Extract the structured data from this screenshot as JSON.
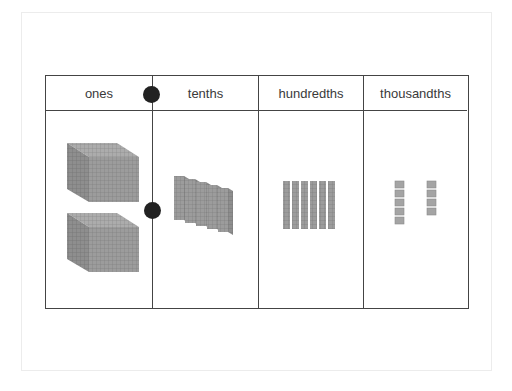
{
  "chart": {
    "title": "",
    "columns": [
      {
        "label": "ones",
        "block_type": "cube",
        "count": 2
      },
      {
        "label": "tenths",
        "block_type": "flat",
        "count": 5
      },
      {
        "label": "hundredths",
        "block_type": "rod",
        "count": 6
      },
      {
        "label": "thousandths",
        "block_type": "unit",
        "count": 9
      }
    ],
    "decimal_point_markers": 2,
    "represented_value": "2.569"
  },
  "colors": {
    "border": "#444444",
    "block_fill": "#9a9a9a",
    "block_shade": "#7d7d7d",
    "block_light": "#b4b4b4",
    "dot": "#222222",
    "text": "#3a3a3a"
  }
}
